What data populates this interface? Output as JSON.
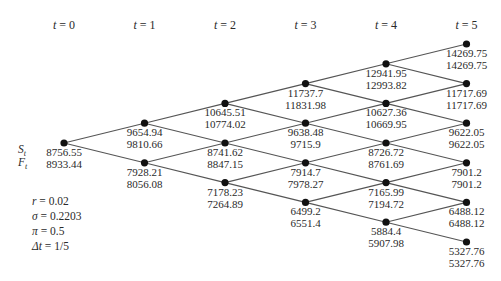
{
  "diagram": {
    "type": "binomial-tree",
    "row_labels": {
      "spot": "S",
      "spot_sub": "t",
      "futures": "F",
      "futures_sub": "t"
    },
    "time_headers": [
      {
        "var": "t",
        "eq": " = 0"
      },
      {
        "var": "t",
        "eq": " = 1"
      },
      {
        "var": "t",
        "eq": " = 2"
      },
      {
        "var": "t",
        "eq": " = 3"
      },
      {
        "var": "t",
        "eq": " = 4"
      },
      {
        "var": "t",
        "eq": " = 5"
      }
    ],
    "parameters": [
      {
        "var": "r",
        "eq": " = 0.02"
      },
      {
        "var": "σ",
        "eq": " = 0.2203"
      },
      {
        "var": "π",
        "eq": " = 0.5"
      },
      {
        "var": "Δt",
        "eq": " = 1/5"
      }
    ],
    "levels": [
      [
        {
          "S": "8756.55",
          "F": "8933.44"
        }
      ],
      [
        {
          "S": "9654.94",
          "F": "9810.66"
        },
        {
          "S": "7928.21",
          "F": "8056.08"
        }
      ],
      [
        {
          "S": "10645.51",
          "F": "10774.02"
        },
        {
          "S": "8741.62",
          "F": "8847.15"
        },
        {
          "S": "7178.23",
          "F": "7264.89"
        }
      ],
      [
        {
          "S": "11737.7",
          "F": "11831.98"
        },
        {
          "S": "9638.48",
          "F": "9715.9"
        },
        {
          "S": "7914.7",
          "F": "7978.27"
        },
        {
          "S": "6499.2",
          "F": "6551.4"
        }
      ],
      [
        {
          "S": "12941.95",
          "F": "12993.82"
        },
        {
          "S": "10627.36",
          "F": "10669.95"
        },
        {
          "S": "8726.72",
          "F": "8761.69"
        },
        {
          "S": "7165.99",
          "F": "7194.72"
        },
        {
          "S": "5884.4",
          "F": "5907.98"
        }
      ],
      [
        {
          "S": "14269.75",
          "F": "14269.75"
        },
        {
          "S": "11717.69",
          "F": "11717.69"
        },
        {
          "S": "9622.05",
          "F": "9622.05"
        },
        {
          "S": "7901.2",
          "F": "7901.2"
        },
        {
          "S": "6488.12",
          "F": "6488.12"
        },
        {
          "S": "5327.76",
          "F": "5327.76"
        }
      ]
    ]
  },
  "colors": {
    "edge": "#555555",
    "node": "#111111",
    "text": "#2a2a2a"
  }
}
